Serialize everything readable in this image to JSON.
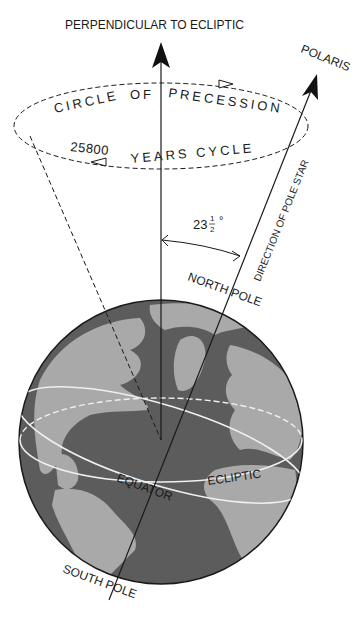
{
  "labels": {
    "perpendicular": "PERPENDICULAR TO ECLIPTIC",
    "polaris": "POLARIS",
    "circle_word1": "CIRCLE",
    "circle_word2": "OF",
    "circle_word3": "PRECESSION",
    "cycle_years": "25800",
    "cycle_text": "YEARS CYCLE",
    "direction": "DIRECTION OF POLE STAR",
    "angle_whole": "23",
    "angle_num": "1",
    "angle_den": "2",
    "angle_deg": "°",
    "north_pole": "NORTH POLE",
    "south_pole": "SOUTH POLE",
    "equator": "EQUATOR",
    "ecliptic": "ECLIPTIC"
  },
  "colors": {
    "ocean": "#5a5a5a",
    "land": "#a8a8a8",
    "line": "#1a1a1a",
    "ring": "#f0f0f0"
  }
}
